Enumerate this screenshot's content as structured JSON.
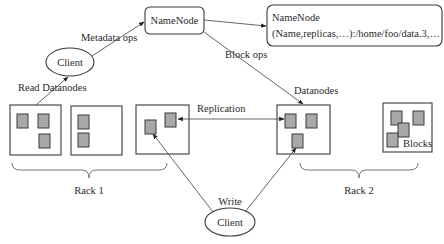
{
  "namenode": {
    "label": "NameNode"
  },
  "metadata": {
    "title": "NameNode",
    "line": "(Name,replicas,…):/home/foo/data.3,…"
  },
  "client_top": {
    "label": "Client"
  },
  "client_bottom": {
    "label": "Client"
  },
  "edges": {
    "metadata_ops": "Metadata ops",
    "read_datanodes": "Read Datanodes",
    "block_ops": "Block ops",
    "datanodes": "Datanodes",
    "replication": "Replication",
    "write": "Write"
  },
  "racks": [
    {
      "label": "Rack 1"
    },
    {
      "label": "Rack 2"
    }
  ],
  "blocks_label": "Blocks",
  "colors": {
    "block_fill": "#a9a9a9",
    "stroke": "#3a3a3a",
    "background": "#ffffff"
  }
}
